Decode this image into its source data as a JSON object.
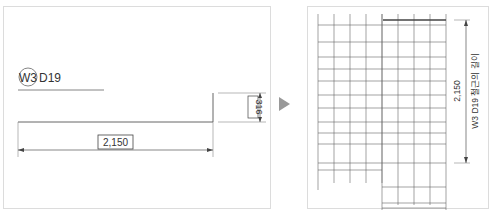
{
  "left_panel": {
    "bar_mark": {
      "circle_label": "W3",
      "bar_label": "D19"
    },
    "dimensions": {
      "horizontal_length": "2,150",
      "hook_length": "316"
    }
  },
  "separator": {
    "icon": "play-arrow-icon"
  },
  "right_panel": {
    "dimension_value": "2,150",
    "dimension_caption": "W3 D19 철근의 길이"
  },
  "colors": {
    "line": "#555555",
    "border": "#dcdcdc",
    "arrow": "#999999"
  }
}
